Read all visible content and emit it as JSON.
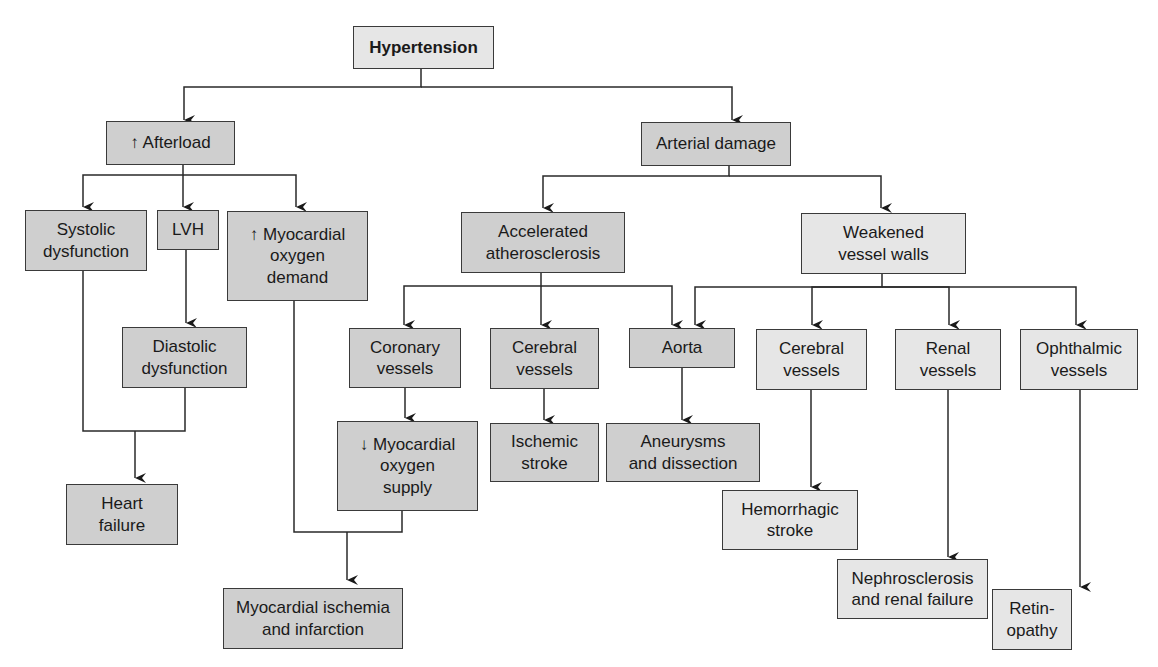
{
  "diagram": {
    "title_node": "Hypertension",
    "nodes": {
      "hypertension": "Hypertension",
      "afterload": "↑ Afterload",
      "arterial_damage": "Arterial damage",
      "systolic": "Systolic\ndysfunction",
      "lvh": "LVH",
      "myo_demand": "↑ Myocardial\noxygen\ndemand",
      "diastolic": "Diastolic\ndysfunction",
      "heart_failure": "Heart\nfailure",
      "accel_athero": "Accelerated\natherosclerosis",
      "weakened_walls": "Weakened\nvessel walls",
      "coronary": "Coronary\nvessels",
      "cerebral_athero": "Cerebral\nvessels",
      "aorta": "Aorta",
      "cerebral_weak": "Cerebral\nvessels",
      "renal": "Renal\nvessels",
      "ophthalmic": "Ophthalmic\nvessels",
      "myo_supply": "↓ Myocardial\noxygen\nsupply",
      "ischemic_stroke": "Ischemic\nstroke",
      "aneurysms": "Aneurysms\nand dissection",
      "hemorrhagic": "Hemorrhagic\nstroke",
      "nephrosclerosis": "Nephrosclerosis\nand renal failure",
      "retinopathy": "Retin-\nopathy",
      "myo_ischemia": "Myocardial ischemia\nand infarction"
    },
    "colors": {
      "dark_fill": "#cfcfcf",
      "light_fill": "#e6e6e6",
      "stroke": "#3a3a3a"
    }
  }
}
